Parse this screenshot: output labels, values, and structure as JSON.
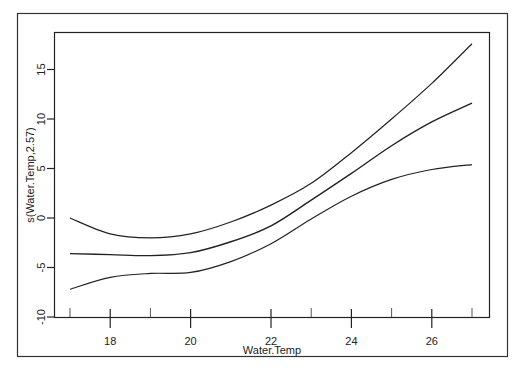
{
  "chart_data": {
    "type": "line",
    "title": "",
    "xlabel": "Water.Temp",
    "ylabel": "s(Water.Temp,2.57)",
    "xlim": [
      16.6,
      27.5
    ],
    "ylim": [
      -10.2,
      19.0
    ],
    "x_ticks": [
      18,
      20,
      22,
      24,
      26
    ],
    "y_ticks": [
      -10,
      -5,
      0,
      5,
      10,
      15
    ],
    "x_tick_labels": [
      "18",
      "20",
      "22",
      "24",
      "26"
    ],
    "y_tick_labels": [
      "-10",
      "-5",
      "0",
      "5",
      "10",
      "15"
    ],
    "grid": false,
    "legend": null,
    "rug": [
      17,
      19,
      23,
      25,
      27
    ],
    "x": [
      17,
      18,
      19,
      20,
      21,
      22,
      23,
      24,
      25,
      26,
      27
    ],
    "series": [
      {
        "name": "upper CI",
        "style": "dashed-thin",
        "values": [
          0.0,
          -1.6,
          -2.0,
          -1.6,
          -0.4,
          1.3,
          3.5,
          6.6,
          10.0,
          13.6,
          17.6
        ]
      },
      {
        "name": "smooth fit",
        "style": "solid",
        "values": [
          -3.6,
          -3.7,
          -3.8,
          -3.5,
          -2.4,
          -0.8,
          1.8,
          4.5,
          7.3,
          9.7,
          11.6
        ]
      },
      {
        "name": "lower CI",
        "style": "dashed-thin",
        "values": [
          -7.2,
          -6.0,
          -5.6,
          -5.5,
          -4.4,
          -2.6,
          -0.1,
          2.2,
          3.9,
          4.9,
          5.4
        ]
      }
    ]
  },
  "labels": {
    "xlabel": "Water.Temp",
    "ylabel": "s(Water.Temp,2.57)"
  }
}
